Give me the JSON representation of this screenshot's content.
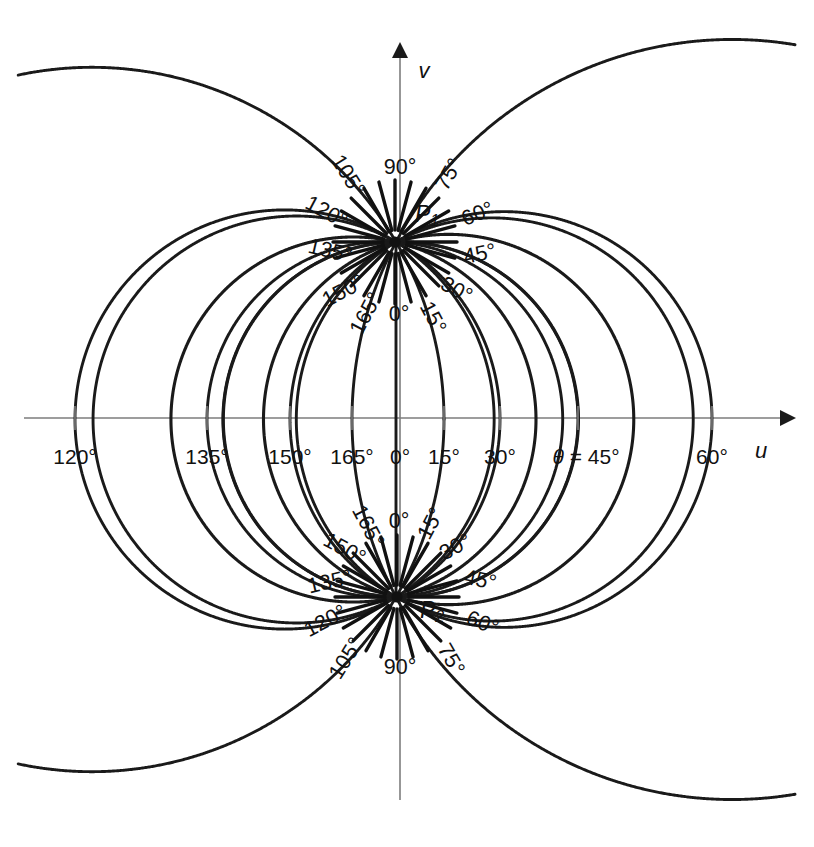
{
  "figure": {
    "background_color": "#ffffff",
    "curve_color": "#1a1a1a",
    "axis_color": "#7d7d7d",
    "text_color": "#111111"
  },
  "axes": {
    "horizontal": {
      "name": "u",
      "label": "u",
      "y": 418,
      "x_start": 24,
      "x_end": 790,
      "arrow": "right"
    },
    "vertical": {
      "name": "v",
      "label": "v",
      "x": 400,
      "y_start": 800,
      "y_end": 50,
      "arrow": "up"
    },
    "origin": {
      "x": 400,
      "y": 418
    }
  },
  "poles": [
    {
      "id": "P1",
      "label": "P",
      "subscript": "1",
      "x": 395,
      "y": 242,
      "label_x": 432,
      "label_y": 216
    },
    {
      "id": "P2",
      "label": "P",
      "subscript": "2",
      "x": 397,
      "y": 597,
      "label_x": 437,
      "label_y": 612
    }
  ],
  "chart_data": {
    "type": "line",
    "xlabel": "u",
    "ylabel": "v",
    "grid": false,
    "legend": "none",
    "geometry": {
      "pole_upper": {
        "u": 0,
        "v": 176
      },
      "pole_lower": {
        "u": 0,
        "v": -179
      },
      "half_separation_px": 177.5,
      "axis_crossing_rule": "u_cross = a * cot(theta/2) scaled to plot extent"
    },
    "series_note": "Each series is a circular arc through both poles labelled by theta.",
    "theta_values_deg": [
      0,
      15,
      30,
      45,
      60,
      75,
      90,
      105,
      120,
      135,
      150,
      165
    ],
    "axis_crossings_px": {
      "0": 400,
      "15": 444,
      "30": 500,
      "45": 578,
      "60": 712,
      "120": 75,
      "135": 207,
      "150": 290,
      "165": 352
    }
  },
  "axis_ticks": [
    {
      "value": "120°",
      "x": 75,
      "y": 452
    },
    {
      "value": "135°",
      "x": 207,
      "y": 452
    },
    {
      "value": "150°",
      "x": 290,
      "y": 452
    },
    {
      "value": "165°",
      "x": 352,
      "y": 452
    },
    {
      "value": "0°",
      "x": 400,
      "y": 452
    },
    {
      "value": "15°",
      "x": 444,
      "y": 452
    },
    {
      "value": "30°",
      "x": 500,
      "y": 452
    },
    {
      "value": "45°",
      "x": 578,
      "y": 452,
      "prefix": "θ = "
    },
    {
      "value": "60°",
      "x": 712,
      "y": 452
    }
  ],
  "axis_tick_marks_x": [
    75,
    207,
    290,
    352,
    444,
    500,
    578,
    712
  ],
  "upper_curve_labels": [
    {
      "value": "90°",
      "x": 400,
      "y": 168,
      "rotate": 0
    },
    {
      "value": "75°",
      "x": 450,
      "y": 175,
      "rotate": -60
    },
    {
      "value": "105°",
      "x": 347,
      "y": 176,
      "rotate": 58
    },
    {
      "value": "120°",
      "x": 326,
      "y": 213,
      "rotate": 28
    },
    {
      "value": "60°",
      "x": 478,
      "y": 215,
      "rotate": -22
    },
    {
      "value": "135°",
      "x": 330,
      "y": 252,
      "rotate": 13
    },
    {
      "value": "45°",
      "x": 480,
      "y": 255,
      "rotate": -12
    },
    {
      "value": "150°",
      "x": 344,
      "y": 292,
      "rotate": -28
    },
    {
      "value": "30°",
      "x": 456,
      "y": 291,
      "rotate": 28
    },
    {
      "value": "165°",
      "x": 367,
      "y": 314,
      "rotate": -62
    },
    {
      "value": "15°",
      "x": 432,
      "y": 318,
      "rotate": 62
    },
    {
      "value": "0°",
      "x": 399,
      "y": 315,
      "rotate": 0
    }
  ],
  "lower_curve_labels": [
    {
      "value": "0°",
      "x": 399,
      "y": 522,
      "rotate": 0
    },
    {
      "value": "165°",
      "x": 367,
      "y": 527,
      "rotate": 62
    },
    {
      "value": "15°",
      "x": 432,
      "y": 524,
      "rotate": -62
    },
    {
      "value": "150°",
      "x": 344,
      "y": 550,
      "rotate": 28
    },
    {
      "value": "30°",
      "x": 456,
      "y": 548,
      "rotate": -28
    },
    {
      "value": "135°",
      "x": 330,
      "y": 583,
      "rotate": -13
    },
    {
      "value": "45°",
      "x": 480,
      "y": 581,
      "rotate": 12
    },
    {
      "value": "120°",
      "x": 326,
      "y": 622,
      "rotate": -28
    },
    {
      "value": "60°",
      "x": 482,
      "y": 624,
      "rotate": 22
    },
    {
      "value": "105°",
      "x": 347,
      "y": 659,
      "rotate": -58
    },
    {
      "value": "75°",
      "x": 450,
      "y": 660,
      "rotate": 60
    },
    {
      "value": "90°",
      "x": 400,
      "y": 668,
      "rotate": 0
    }
  ],
  "annotations": {
    "theta_equals_prefix": "θ = "
  }
}
